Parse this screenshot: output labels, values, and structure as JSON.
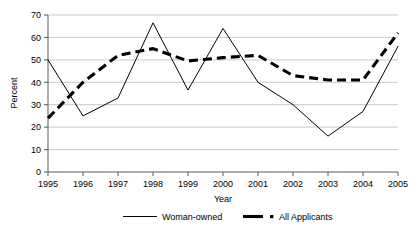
{
  "chart_data": {
    "type": "line",
    "title": "",
    "subtitle": "",
    "xlabel": "Year",
    "ylabel": "Percent",
    "categories": [
      "1995",
      "1996",
      "1997",
      "1998",
      "1999",
      "2000",
      "2001",
      "2002",
      "2003",
      "2004",
      "2005"
    ],
    "x": [
      1995,
      1996,
      1997,
      1998,
      1999,
      2000,
      2001,
      2002,
      2003,
      2004,
      2005
    ],
    "series": [
      {
        "name": "Woman-owned",
        "style": "solid-thin",
        "values": [
          50,
          25,
          33,
          66.5,
          36.5,
          64,
          40,
          30,
          16,
          27,
          56
        ]
      },
      {
        "name": "All Applicants",
        "style": "dashed-thick",
        "values": [
          24,
          40,
          52,
          55,
          49.5,
          51,
          52,
          43,
          41,
          41,
          62
        ]
      }
    ],
    "ylim": [
      0,
      70
    ],
    "ytick_values": [
      0,
      10,
      20,
      30,
      40,
      50,
      60,
      70
    ],
    "ytick_labels": [
      "0",
      "10",
      "20",
      "30",
      "40",
      "50",
      "60",
      "70"
    ],
    "xlim": [
      1995,
      2005
    ],
    "grid": "horizontal",
    "legend_position": "bottom",
    "legend": [
      {
        "label": "Woman-owned",
        "style": "solid-thin"
      },
      {
        "label": "All Applicants",
        "style": "dashed-thick-dot"
      }
    ],
    "colors": {
      "series": "#000000",
      "grid": "#b3b3b3",
      "axis": "#5a5a5a",
      "background": "#ffffff"
    }
  }
}
